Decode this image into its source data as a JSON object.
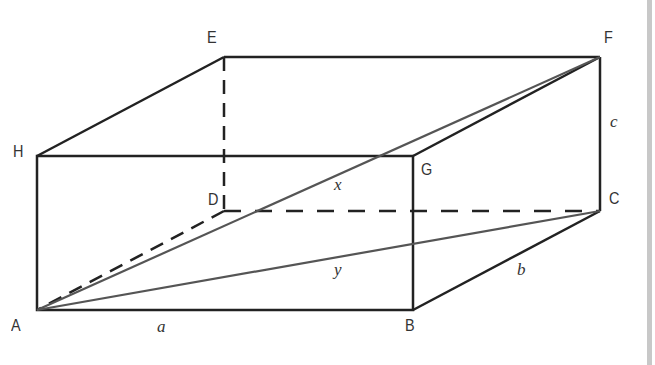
{
  "figure": {
    "vertices": {
      "A": {
        "label": "A",
        "x": 37,
        "y": 310
      },
      "B": {
        "label": "B",
        "x": 413,
        "y": 310
      },
      "C": {
        "label": "C",
        "x": 600,
        "y": 211
      },
      "D": {
        "label": "D",
        "x": 224,
        "y": 211
      },
      "E": {
        "label": "E",
        "x": 224,
        "y": 57
      },
      "F": {
        "label": "F",
        "x": 600,
        "y": 57
      },
      "G": {
        "label": "G",
        "x": 413,
        "y": 156
      },
      "H": {
        "label": "H",
        "x": 37,
        "y": 156
      }
    },
    "edge_labels": {
      "a": "a",
      "b": "b",
      "c": "c",
      "x": "x",
      "y": "y"
    },
    "colors": {
      "edge": "#222222",
      "diagonal": "#555555",
      "label": "#333333",
      "scrollbar": "#c8c8c8"
    }
  }
}
